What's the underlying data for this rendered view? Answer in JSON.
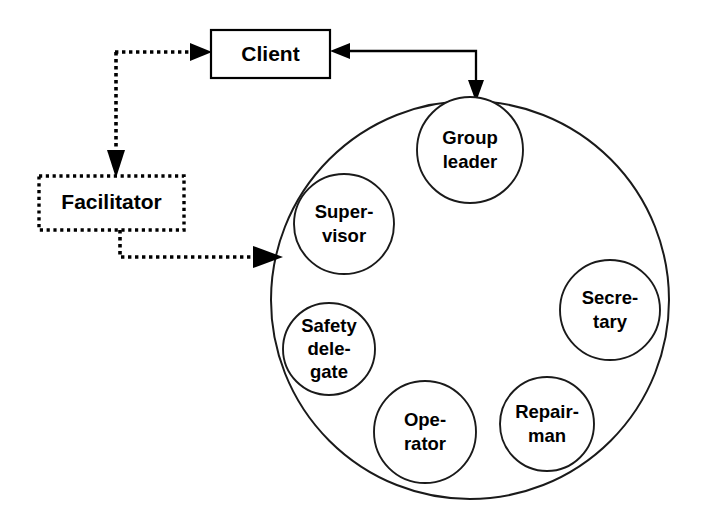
{
  "diagram": {
    "type": "organizational-role-diagram",
    "colors": {
      "stroke": "#000000",
      "circle_stroke": "#1a1a1a",
      "fill": "#ffffff",
      "background": "#ffffff"
    },
    "external_nodes": [
      {
        "id": "client",
        "label": "Client",
        "shape": "rectangle",
        "border_style": "solid"
      },
      {
        "id": "facilitator",
        "label": "Facilitator",
        "shape": "rectangle",
        "border_style": "dotted"
      }
    ],
    "group": {
      "id": "work-group",
      "shape": "circle",
      "border_style": "solid",
      "members": [
        {
          "id": "group-leader",
          "label_line1": "Group",
          "label_line2": "leader",
          "label_line3": ""
        },
        {
          "id": "secretary",
          "label_line1": "Secre-",
          "label_line2": "tary",
          "label_line3": ""
        },
        {
          "id": "repairman",
          "label_line1": "Repair-",
          "label_line2": "man",
          "label_line3": ""
        },
        {
          "id": "operator",
          "label_line1": "Ope-",
          "label_line2": "rator",
          "label_line3": ""
        },
        {
          "id": "safety-delegate",
          "label_line1": "Safety",
          "label_line2": "dele-",
          "label_line3": "gate"
        },
        {
          "id": "supervisor",
          "label_line1": "Super-",
          "label_line2": "visor",
          "label_line3": ""
        }
      ]
    },
    "connectors": [
      {
        "id": "facilitator-to-client",
        "from": "facilitator-link",
        "to": "client",
        "style": "dashed",
        "arrow": "to-client"
      },
      {
        "id": "link-to-facilitator",
        "from": "facilitator-link",
        "to": "facilitator",
        "style": "dashed",
        "arrow": "to-facilitator"
      },
      {
        "id": "facilitator-to-group",
        "from": "facilitator",
        "to": "work-group",
        "style": "dashed",
        "arrow": "to-group"
      },
      {
        "id": "group-to-client",
        "from": "work-group",
        "to": "client",
        "style": "solid",
        "arrow": "both"
      }
    ]
  }
}
